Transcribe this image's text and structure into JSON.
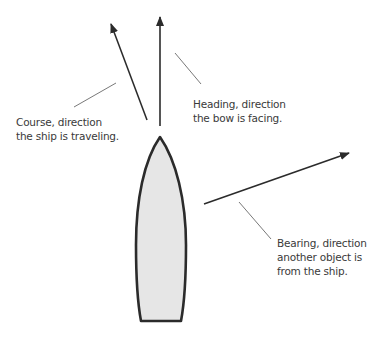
{
  "diagram": {
    "labels": {
      "course": "Course, direction\nthe ship is traveling.",
      "heading": "Heading, direction\nthe bow is facing.",
      "bearing": "Bearing, direction\nanother object is\nfrom the ship."
    },
    "colors": {
      "ship_fill": "#e6e6e6",
      "ship_stroke": "#2b2b2b",
      "arrow": "#2b2b2b",
      "leader": "#555555",
      "text": "#3a3a3a"
    }
  }
}
